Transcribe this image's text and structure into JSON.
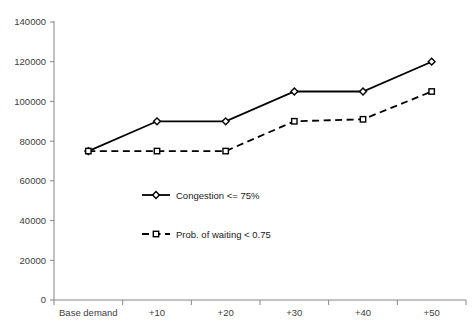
{
  "chart_data": {
    "type": "line",
    "title": "",
    "xlabel": "",
    "ylabel": "",
    "categories": [
      "Base demand",
      "+10",
      "+20",
      "+30",
      "+40",
      "+50"
    ],
    "series": [
      {
        "name": "Congestion <= 75%",
        "values": [
          75000,
          90000,
          90000,
          105000,
          105000,
          120000
        ],
        "line_style": "solid",
        "marker": "diamond",
        "color": "#000000"
      },
      {
        "name": "Prob. of waiting < 0.75",
        "values": [
          75000,
          75000,
          75000,
          90000,
          91000,
          105000
        ],
        "line_style": "dashed",
        "marker": "square",
        "color": "#000000"
      }
    ],
    "ylim": [
      0,
      140000
    ],
    "ytick_values": [
      0,
      20000,
      40000,
      60000,
      80000,
      100000,
      120000,
      140000
    ],
    "ytick_labels": [
      "0",
      "20000",
      "40000",
      "60000",
      "80000",
      "100000",
      "120000",
      "140000"
    ],
    "grid": false,
    "legend_position": "inside-center-left"
  },
  "axes": {
    "y_axis_name": "value-axis",
    "x_axis_name": "category-axis"
  },
  "legend": {
    "entries": [
      {
        "label": "Congestion <= 75%"
      },
      {
        "label": "Prob. of waiting < 0.75"
      }
    ]
  },
  "colors": {
    "series": "#000000",
    "axis": "#868686",
    "text": "#404040",
    "background": "#ffffff"
  }
}
